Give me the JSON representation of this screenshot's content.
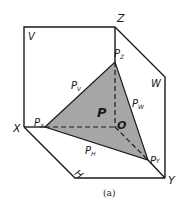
{
  "figure": {
    "caption": "(a)",
    "colors": {
      "line": "#1a1a1a",
      "plane_fill": "#a6a6a6",
      "background": "#ffffff"
    },
    "planes": {
      "V": "V",
      "W": "W",
      "H": "H"
    },
    "axes": {
      "X": "X",
      "Y": "Y",
      "Z": "Z",
      "origin": "O"
    },
    "plane_P": {
      "name": "P",
      "traces": {
        "PV": {
          "base": "P",
          "sub": "V"
        },
        "PW": {
          "base": "P",
          "sub": "W"
        },
        "PH": {
          "base": "P",
          "sub": "H"
        }
      },
      "intercepts": {
        "PX": {
          "base": "P",
          "sub": "X"
        },
        "PY": {
          "base": "P",
          "sub": "Y"
        },
        "PZ": {
          "base": "P",
          "sub": "Z"
        }
      }
    }
  }
}
